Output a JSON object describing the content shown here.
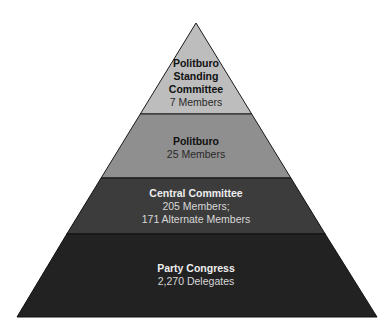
{
  "diagram": {
    "type": "pyramid",
    "tiers": [
      {
        "title_lines": [
          "Politburo",
          "Standing",
          "Committee"
        ],
        "detail_lines": [
          "7 Members"
        ],
        "color": "#bdbdbd"
      },
      {
        "title_lines": [
          "Politburo"
        ],
        "detail_lines": [
          "25 Members"
        ],
        "color": "#8f8f8f"
      },
      {
        "title_lines": [
          "Central Committee"
        ],
        "detail_lines": [
          "205 Members;",
          "171 Alternate Members"
        ],
        "color": "#3c3c3c"
      },
      {
        "title_lines": [
          "Party Congress"
        ],
        "detail_lines": [
          "2,270 Delegates"
        ],
        "color": "#222222"
      }
    ]
  }
}
